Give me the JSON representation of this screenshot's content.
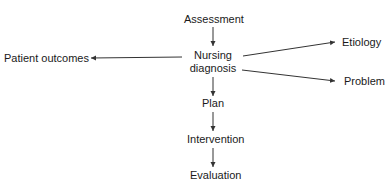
{
  "diagram": {
    "nodes": [
      {
        "id": "assessment",
        "label": "Assessment"
      },
      {
        "id": "nursing_diagnosis",
        "label": "Nursing\ndiagnosis",
        "line1": "Nursing",
        "line2": "diagnosis"
      },
      {
        "id": "plan",
        "label": "Plan"
      },
      {
        "id": "intervention",
        "label": "Intervention"
      },
      {
        "id": "evaluation",
        "label": "Evaluation"
      },
      {
        "id": "patient_outcomes",
        "label": "Patient outcomes"
      },
      {
        "id": "etiology",
        "label": "Etiology"
      },
      {
        "id": "problem",
        "label": "Problem"
      }
    ],
    "edges": [
      {
        "from": "assessment",
        "to": "nursing_diagnosis"
      },
      {
        "from": "nursing_diagnosis",
        "to": "plan"
      },
      {
        "from": "plan",
        "to": "intervention"
      },
      {
        "from": "intervention",
        "to": "evaluation"
      },
      {
        "from": "nursing_diagnosis",
        "to": "patient_outcomes"
      },
      {
        "from": "nursing_diagnosis",
        "to": "etiology"
      },
      {
        "from": "nursing_diagnosis",
        "to": "problem"
      }
    ],
    "colors": {
      "line": "#333333",
      "text": "#1a1a1a",
      "background": "#ffffff"
    }
  }
}
